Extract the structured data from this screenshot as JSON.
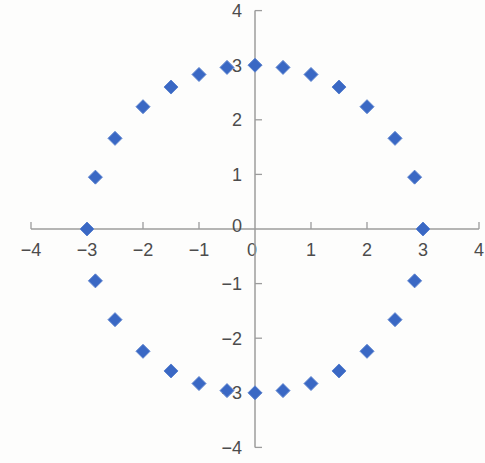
{
  "chart_data": {
    "type": "scatter",
    "title": "",
    "xlabel": "",
    "ylabel": "",
    "xlim": [
      -4,
      4
    ],
    "ylim": [
      -4,
      4
    ],
    "grid": false,
    "legend": false,
    "x_tick_values": [
      -4,
      -3,
      -2,
      -1,
      0,
      1,
      2,
      3,
      4
    ],
    "x_tick_labels": [
      "−4",
      "−3",
      "−2",
      "−1",
      "0",
      "1",
      "2",
      "3",
      "4"
    ],
    "y_tick_values": [
      -4,
      -3,
      -2,
      -1,
      0,
      1,
      2,
      3,
      4
    ],
    "y_tick_labels": [
      "−4",
      "−3",
      "−2",
      "−1",
      "0",
      "1",
      "2",
      "3",
      "4"
    ],
    "points": [
      [
        3,
        0
      ],
      [
        2.85,
        0.95
      ],
      [
        2.5,
        1.66
      ],
      [
        2,
        2.24
      ],
      [
        1.5,
        2.6
      ],
      [
        1,
        2.83
      ],
      [
        0.5,
        2.96
      ],
      [
        0,
        3
      ],
      [
        -0.5,
        2.96
      ],
      [
        -1,
        2.83
      ],
      [
        -1.5,
        2.6
      ],
      [
        -2,
        2.24
      ],
      [
        -2.5,
        1.66
      ],
      [
        -2.85,
        0.95
      ],
      [
        -3,
        0
      ],
      [
        -2.85,
        -0.95
      ],
      [
        -2.5,
        -1.66
      ],
      [
        -2,
        -2.24
      ],
      [
        -1.5,
        -2.6
      ],
      [
        -1,
        -2.83
      ],
      [
        -0.5,
        -2.96
      ],
      [
        0,
        -3
      ],
      [
        0.5,
        -2.96
      ],
      [
        1,
        -2.83
      ],
      [
        1.5,
        -2.6
      ],
      [
        2,
        -2.24
      ],
      [
        2.5,
        -1.66
      ],
      [
        2.85,
        -0.95
      ]
    ],
    "marker": {
      "shape": "diamond",
      "color": "#3a68c4",
      "edge_color": "#5c83cf",
      "size_px": 14
    },
    "axis_color": "#9c9c9c",
    "tick_label_color": "#4c4c4c",
    "background_color": "#fdfdfc"
  }
}
